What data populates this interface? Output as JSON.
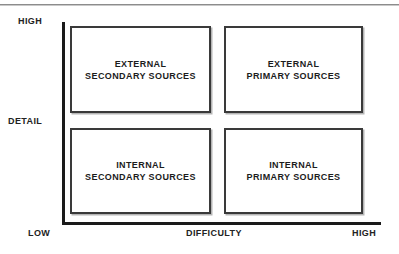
{
  "figure": {
    "axes": {
      "y": {
        "name": "DETAIL",
        "high_label": "HIGH",
        "low_label": "LOW"
      },
      "x": {
        "name": "DIFFICULTY",
        "low_label": "LOW",
        "high_label": "HIGH"
      }
    },
    "quadrants": [
      {
        "id": "top-left",
        "label": "EXTERNAL\nSECONDARY SOURCES",
        "line1": "EXTERNAL",
        "line2": "SECONDARY SOURCES",
        "detail": "HIGH",
        "difficulty": "LOW"
      },
      {
        "id": "top-right",
        "label": "EXTERNAL\nPRIMARY SOURCES",
        "line1": "EXTERNAL",
        "line2": "PRIMARY SOURCES",
        "detail": "HIGH",
        "difficulty": "HIGH"
      },
      {
        "id": "bottom-left",
        "label": "INTERNAL\nSECONDARY SOURCES",
        "line1": "INTERNAL",
        "line2": "SECONDARY SOURCES",
        "detail": "LOW",
        "difficulty": "LOW"
      },
      {
        "id": "bottom-right",
        "label": "INTERNAL\nPRIMARY SOURCES",
        "line1": "INTERNAL",
        "line2": "PRIMARY SOURCES",
        "detail": "LOW",
        "difficulty": "HIGH"
      }
    ],
    "colors": {
      "background": "#ffffff",
      "axis": "#1a1a1a",
      "box_border": "#3a3a3a",
      "text": "#1c1c1c",
      "rule": "#8c8c8c"
    }
  },
  "chart_data": {
    "type": "table",
    "title": "",
    "xlabel": "DIFFICULTY",
    "ylabel": "DETAIL",
    "x_ticks": [
      "LOW",
      "HIGH"
    ],
    "y_ticks": [
      "LOW",
      "HIGH"
    ],
    "grid": false,
    "categories": [
      "LOW DIFFICULTY",
      "HIGH DIFFICULTY"
    ],
    "rows": [
      "HIGH DETAIL",
      "LOW DETAIL"
    ],
    "cells": [
      [
        "EXTERNAL SECONDARY SOURCES",
        "EXTERNAL PRIMARY SOURCES"
      ],
      [
        "INTERNAL SECONDARY SOURCES",
        "INTERNAL PRIMARY SOURCES"
      ]
    ]
  }
}
